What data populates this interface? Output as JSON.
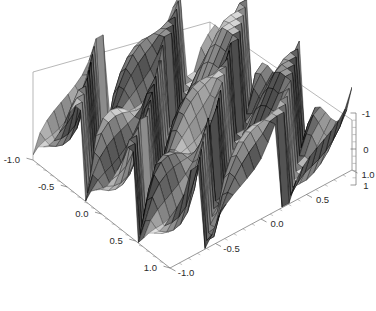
{
  "figure": {
    "kind": "3d-surface-plot",
    "style": "mathematica-plot3d",
    "background_color": "#ffffff",
    "box_edge_color": "#9a9a9a",
    "mesh_line_color": "#3a3a3a",
    "surface_fill_light": "#d8d8d8",
    "surface_fill_dark": "#6a6a6a"
  },
  "chart_data": {
    "type": "surface",
    "title": "",
    "xlabel": "",
    "ylabel": "",
    "zlabel": "",
    "grid": false,
    "legend": null,
    "xlim": [
      -1.0,
      1.0
    ],
    "ylim": [
      -1.0,
      1.0
    ],
    "zlim": [
      -1.5,
      1.5
    ],
    "x_ticks": [
      -1.0,
      -0.5,
      0.0,
      0.5,
      1.0
    ],
    "x_tick_labels": [
      "-1.0",
      "-0.5",
      "0.0",
      "0.5",
      "1.0"
    ],
    "y_ticks": [
      -1.0,
      -0.5,
      0.0,
      0.5,
      1.0
    ],
    "y_tick_labels": [
      "-1.0",
      "-0.5",
      "0.0",
      "0.5",
      "1.0"
    ],
    "z_ticks": [
      -1,
      0,
      1
    ],
    "z_tick_labels": [
      "-1",
      "0",
      "1"
    ],
    "minor_ticks_per_interval": 4,
    "surface_description": "Oscillatory periodic ridge surface with vertical discontinuity walls; clipped at z=+/-1.5",
    "wave_count_x": 5,
    "wave_count_y": 5,
    "mesh_rows": 26,
    "mesh_cols": 26
  },
  "axes": {
    "x_axis": {
      "name": "x-axis",
      "position": "front-left",
      "labels": [
        "-1.0",
        "-0.5",
        "0.0",
        "0.5",
        "1.0"
      ]
    },
    "y_axis": {
      "name": "y-axis",
      "position": "front-right",
      "labels": [
        "-1.0",
        "-0.5",
        "0.0",
        "0.5",
        "1.0"
      ]
    },
    "z_axis": {
      "name": "z-axis",
      "position": "right-vertical",
      "labels": [
        "1",
        "0",
        "-1"
      ]
    }
  }
}
